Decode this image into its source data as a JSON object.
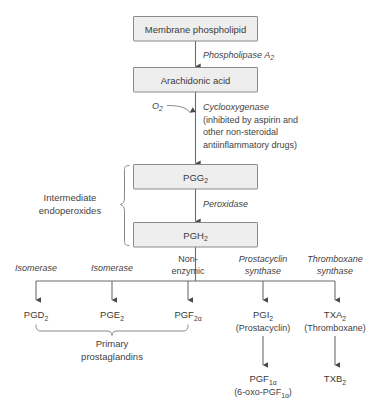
{
  "diagram": {
    "accent_color": "#eeeeee",
    "line_color": "#6d6d6d",
    "text_color": "#3a3a3a"
  },
  "boxes": {
    "membrane_phospholipid": "Membrane phospholipid",
    "arachidonic_acid": "Arachidonic acid",
    "pgg2_base": "PGG",
    "pgg2_sub": "2",
    "pgh2_base": "PGH",
    "pgh2_sub": "2"
  },
  "enzymes": {
    "phospholipase": "Phospholipase A",
    "phospholipase_sub": "2",
    "cyclooxygenase": "Cyclooxygenase",
    "cox_note_line1": "(inhibited by aspirin and",
    "cox_note_line2": "other non-steroidal",
    "cox_note_line3": "antiinflammatory drugs)",
    "oxygen_base": "O",
    "oxygen_sub": "2",
    "peroxidase": "Peroxidase"
  },
  "brackets": {
    "intermediate_line1": "Intermediate",
    "intermediate_line2": "endoperoxides",
    "primary_line1": "Primary",
    "primary_line2": "prostaglandins"
  },
  "branches": [
    {
      "enzyme_line1": "Isomerase",
      "enzyme_line2": "",
      "enzyme_italic": true,
      "product_base": "PGD",
      "product_sub": "2",
      "product_alias": ""
    },
    {
      "enzyme_line1": "Isomerase",
      "enzyme_line2": "",
      "enzyme_italic": true,
      "product_base": "PGE",
      "product_sub": "2",
      "product_alias": ""
    },
    {
      "enzyme_line1": "Non-",
      "enzyme_line2": "enzymic",
      "enzyme_italic": false,
      "product_base": "PGF",
      "product_sub": "2α",
      "product_alias": ""
    },
    {
      "enzyme_line1": "Prostacyclin",
      "enzyme_line2": "synthase",
      "enzyme_italic": true,
      "product_base": "PGI",
      "product_sub": "2",
      "product_alias": "(Prostacyclin)"
    },
    {
      "enzyme_line1": "Thromboxane",
      "enzyme_line2": "synthase",
      "enzyme_italic": true,
      "product_base": "TXA",
      "product_sub": "2",
      "product_alias": "(Thromboxane)"
    }
  ],
  "metabolites": [
    {
      "name_base": "PGF",
      "name_sub": "1α",
      "alias_pre": "(6-oxo-PGF",
      "alias_sub": "1α",
      "alias_post": ")"
    },
    {
      "name_base": "TXB",
      "name_sub": "2",
      "alias_pre": "",
      "alias_sub": "",
      "alias_post": ""
    }
  ]
}
